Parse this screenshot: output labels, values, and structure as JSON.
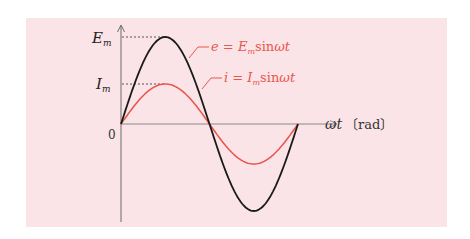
{
  "chart_data": {
    "type": "line",
    "title": "",
    "xlabel": "ωt〔rad〕",
    "ylabel": "",
    "origin_label": "0",
    "y_tick_labels": [
      "E_m",
      "I_m"
    ],
    "x": [
      0,
      0.7854,
      1.5708,
      2.3562,
      3.1416,
      3.927,
      4.7124,
      5.4978,
      6.2832
    ],
    "series": [
      {
        "name": "e = E_m sin ωt",
        "color": "#1a1a1a",
        "amplitude": 1.0,
        "values": [
          0,
          0.707,
          1.0,
          0.707,
          0,
          -0.707,
          -1.0,
          -0.707,
          0
        ]
      },
      {
        "name": "i = I_m sin ωt",
        "color": "#e8574f",
        "amplitude": 0.46,
        "values": [
          0,
          0.325,
          0.46,
          0.325,
          0,
          -0.325,
          -0.46,
          -0.325,
          0
        ]
      }
    ],
    "xlim": [
      0,
      6.2832
    ],
    "ylim": [
      -1.0,
      1.1
    ],
    "grid": false,
    "legend_position": "inline annotations"
  },
  "labels": {
    "em": "E",
    "em_sub": "m",
    "im": "I",
    "im_sub": "m",
    "origin": "0",
    "x_axis": "ωt",
    "x_unit": "〔rad〕",
    "eq_e_lhs": "e",
    "eq_e_rhs_var": "E",
    "eq_e_rhs_sub": "m",
    "eq_e_func": "sin",
    "eq_e_arg": "ωt",
    "eq_i_lhs": "i",
    "eq_i_rhs_var": "I",
    "eq_i_rhs_sub": "m",
    "eq_i_func": "sin",
    "eq_i_arg": "ωt",
    "equals": " = "
  },
  "colors": {
    "background": "#fbe4e7",
    "voltage_curve": "#1a1a1a",
    "current_curve": "#e8574f",
    "axis": "#6b6b6b",
    "label_red": "#e8574f"
  }
}
